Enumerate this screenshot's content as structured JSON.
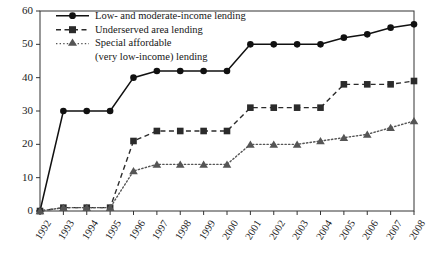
{
  "chart_data": {
    "type": "line",
    "title": "",
    "subtitle": "",
    "xlabel": "",
    "ylabel": "",
    "ylim": [
      0,
      60
    ],
    "yticks": [
      0,
      10,
      20,
      30,
      40,
      50,
      60
    ],
    "grid": false,
    "legend_position": "top-left",
    "categories": [
      "1992",
      "1993",
      "1994",
      "1995",
      "1996",
      "1997",
      "1998",
      "1999",
      "2000",
      "2001",
      "2002",
      "2003",
      "2004",
      "2005",
      "2006",
      "2007",
      "2008"
    ],
    "series": [
      {
        "name": "Low- and moderate-income lending",
        "marker": "circle",
        "line_style": "solid",
        "color": "#111111",
        "values": [
          0,
          30,
          30,
          30,
          40,
          42,
          42,
          42,
          42,
          50,
          50,
          50,
          50,
          52,
          53,
          55,
          56
        ]
      },
      {
        "name": "Underserved area lending",
        "marker": "square",
        "line_style": "dashed",
        "color": "#2b2b2b",
        "values": [
          0,
          1,
          1,
          1,
          21,
          24,
          24,
          24,
          24,
          31,
          31,
          31,
          31,
          38,
          38,
          38,
          39
        ]
      },
      {
        "name": "Special affordable (very low-income) lending",
        "marker": "triangle",
        "line_style": "dotted",
        "color": "#555555",
        "values": [
          0,
          1,
          1,
          1,
          12,
          14,
          14,
          14,
          14,
          20,
          20,
          20,
          21,
          22,
          23,
          25,
          27
        ]
      }
    ]
  },
  "legend": {
    "items": [
      {
        "label": "Low- and moderate-income lending",
        "sub": ""
      },
      {
        "label": "Underserved area lending",
        "sub": ""
      },
      {
        "label": "Special affordable",
        "sub": "(very low-income) lending"
      }
    ]
  },
  "axes": {
    "y_tick_labels": [
      "0",
      "10",
      "20",
      "30",
      "40",
      "50",
      "60"
    ],
    "x_tick_labels": [
      "1992",
      "1993",
      "1994",
      "1995",
      "1996",
      "1997",
      "1998",
      "1999",
      "2000",
      "2001",
      "2002",
      "2003",
      "2004",
      "2005",
      "2006",
      "2007",
      "2008"
    ]
  },
  "colors": {
    "axis": "#333333",
    "series_1": "#111111",
    "series_2": "#2b2b2b",
    "series_3": "#555555",
    "background": "#ffffff"
  }
}
